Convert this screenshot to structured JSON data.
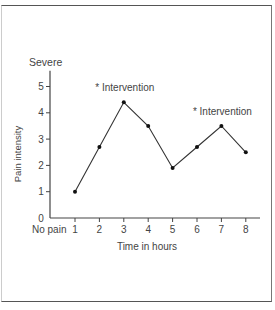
{
  "chart_data": {
    "type": "line",
    "title": "",
    "xlabel": "Time in hours",
    "ylabel": "Pain intensity",
    "y_top_label": "Severe",
    "x_origin_label": "No pain",
    "x": [
      1,
      2,
      3,
      4,
      5,
      6,
      7,
      8
    ],
    "x_tick_labels": [
      "1",
      "2",
      "3",
      "4",
      "5",
      "6",
      "7",
      "8"
    ],
    "y_tick_labels": [
      "0",
      "1",
      "2",
      "3",
      "4",
      "5"
    ],
    "series": [
      {
        "name": "Pain intensity",
        "values": [
          1.0,
          2.7,
          4.4,
          3.5,
          1.9,
          2.7,
          3.5,
          2.5
        ]
      }
    ],
    "annotations": [
      {
        "x": 3,
        "text": "* Intervention"
      },
      {
        "x": 7,
        "text": "* Intervention"
      }
    ],
    "ylim": [
      0,
      5.5
    ],
    "xlim": [
      0,
      8.5
    ],
    "grid": false,
    "legend": "none",
    "colors": {
      "line": "#333333",
      "axis": "#444444",
      "text": "#444444"
    }
  }
}
